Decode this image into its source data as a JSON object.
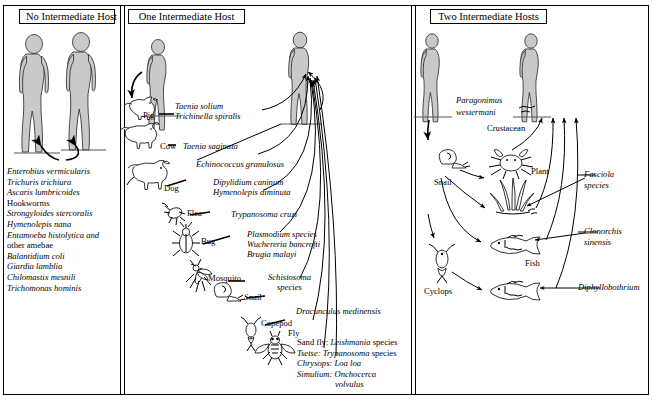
{
  "figure": {
    "panels": [
      {
        "id": "no-intermediate-host",
        "title": "No Intermediate Host"
      },
      {
        "id": "one-intermediate-host",
        "title": "One Intermediate Host"
      },
      {
        "id": "two-intermediate-hosts",
        "title": "Two Intermediate Hosts"
      }
    ]
  },
  "panel_none": {
    "title": "No Intermediate Host",
    "species": [
      "Enterobius vermicularis",
      "Trichuris trichiura",
      "Ascaris lumbricoides",
      "Hookworms",
      "Strongyloides stercoralis",
      "Hymenolepis nana",
      "Entamoeba histolytica and",
      "   other amebae",
      "Balantidium coli",
      "Giardia lamblia",
      "Chilomastix mesnili",
      "Trichomonas hominis"
    ]
  },
  "panel_one": {
    "title": "One Intermediate Host",
    "hosts": [
      {
        "name": "Pig"
      },
      {
        "name": "Cow"
      },
      {
        "name": "Dog"
      },
      {
        "name": "Flea"
      },
      {
        "name": "Bug"
      },
      {
        "name": "Mosquito"
      },
      {
        "name": "Snail"
      },
      {
        "name": "Copepod"
      },
      {
        "name": "Fly"
      }
    ],
    "parasites": {
      "pig_line1": "Taenia solium",
      "pig_line2": "Trichinella spiralis",
      "cow": "Taenia saginata",
      "dog1": "Echinococcus granulosus",
      "flea1": "Dipylidium caninum",
      "flea2": "Hymenolepis diminuta",
      "bug": "Trypanosoma cruzi",
      "mosq1": "Plasmodium species",
      "mosq2": "Wuchereria bancrofti",
      "mosq3": "Brugia malayi",
      "snail1": "Schistosoma",
      "snail2": "species",
      "copepod": "Dracunculus medinensis"
    },
    "fly_vectors": [
      {
        "vector": "Sand fly:",
        "parasite": "Leishmania",
        "suffix": " species"
      },
      {
        "vector": "Tsetse:",
        "parasite": "Trypanosoma",
        "suffix": " species"
      },
      {
        "vector": "Chrysops:",
        "parasite": " Loa loa",
        "suffix": ""
      },
      {
        "vector": "Simulium:",
        "parasite": " Onchocerca",
        "suffix": ""
      },
      {
        "vector": "",
        "parasite": "volvulus",
        "suffix": ""
      }
    ]
  },
  "panel_two": {
    "title": "Two Intermediate Hosts",
    "hosts": [
      {
        "name": "Crustacean"
      },
      {
        "name": "Snail"
      },
      {
        "name": "Plant"
      },
      {
        "name": "Fish"
      },
      {
        "name": "Cyclops"
      }
    ],
    "parasites": {
      "paragonimus1": "Paragonimus",
      "paragonimus2": "westermani",
      "fasciola1": "Fasciola",
      "fasciola2": "species",
      "clonorchis1": "Clonorchis",
      "clonorchis2": "sinensis",
      "diphyllobothrium": "Diphyllobothrium"
    }
  },
  "colors": {
    "ink": "#000000",
    "figure_fill": "#c9c9c9",
    "figure_stroke": "#3a3a3a",
    "paper": "#ffffff"
  }
}
